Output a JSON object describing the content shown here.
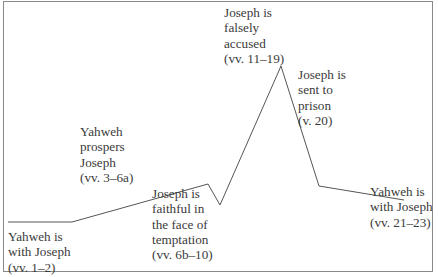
{
  "diagram": {
    "type": "plot-line",
    "line_color": "#555555",
    "frame_color": "#8a8a8a",
    "points": [
      [
        8,
        222
      ],
      [
        72,
        222
      ],
      [
        208,
        184
      ],
      [
        220,
        205
      ],
      [
        281,
        66
      ],
      [
        319,
        186
      ],
      [
        404,
        200
      ]
    ],
    "labels": [
      {
        "id": "yahweh-with-joseph-1",
        "lines": [
          "Yahweh is",
          "with Joseph",
          "(vv. 1–2)"
        ]
      },
      {
        "id": "yahweh-prospers",
        "lines": [
          "Yahweh",
          "prospers",
          "Joseph",
          "(vv. 3–6a)"
        ]
      },
      {
        "id": "joseph-faithful",
        "lines": [
          "Joseph is",
          "faithful in",
          "the face of",
          "temptation",
          "(vv. 6b–10)"
        ]
      },
      {
        "id": "joseph-accused",
        "lines": [
          "Joseph is",
          "falsely",
          "accused",
          "(vv. 11–19)"
        ]
      },
      {
        "id": "joseph-prison",
        "lines": [
          "Joseph is",
          "sent to",
          "prison",
          "(v. 20)"
        ]
      },
      {
        "id": "yahweh-with-joseph-2",
        "lines": [
          "Yahweh is",
          "with Joseph",
          "(vv. 21–23)"
        ]
      }
    ]
  }
}
